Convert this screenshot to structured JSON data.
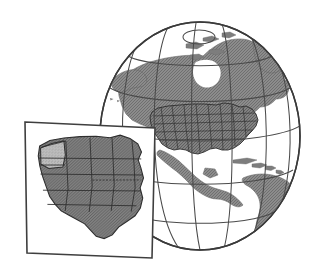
{
  "figure": {
    "title": "Globe showing North America with western United States inset map",
    "width": 323,
    "height": 274,
    "background_color": "#ffffff",
    "style": "line-art halftone illustration"
  },
  "colors": {
    "background": "#ffffff",
    "outline": "#3a3a3a",
    "graticule": "#4a4a4a",
    "land_fill": "#8a8a8a",
    "land_fill_dark": "#7d7d7d",
    "states_fill": "#878787",
    "inset_state_fill": "#858585",
    "inset_highlight_fill": "#b4b4b4",
    "inset_frame_fill": "#ffffff",
    "inset_frame_border": "#3f3f3f",
    "state_border": "#2e2e2e"
  },
  "globe": {
    "name": "earth-globe",
    "center_x": 200,
    "center_y": 136,
    "radius_x": 100,
    "radius_y": 114,
    "graticule": {
      "visible": true,
      "latitude_lines": 5,
      "longitude_lines": 7,
      "polar_cap_visible": true,
      "polar_cap_label": "north-pole-cap"
    },
    "landmasses": [
      {
        "name": "north-america",
        "label": "North America"
      },
      {
        "name": "greenland",
        "label": "Greenland"
      },
      {
        "name": "central-america",
        "label": "Central America"
      },
      {
        "name": "caribbean-islands",
        "label": "Caribbean Islands"
      },
      {
        "name": "south-america-north",
        "label": "northern South America"
      }
    ],
    "overlay": {
      "name": "contiguous-united-states",
      "label": "Contiguous United States",
      "state_borders_visible": true
    }
  },
  "inset": {
    "name": "western-us-inset-map",
    "label": "Western United States",
    "frame": {
      "corners": [
        [
          25,
          122
        ],
        [
          155,
          128
        ],
        [
          152,
          258
        ],
        [
          27,
          253
        ]
      ],
      "rotated": true,
      "border_width": 1.6
    },
    "highlighted_state": {
      "name": "oregon",
      "label": "Oregon",
      "fill": "#b4b4b4"
    },
    "states": [
      "Washington",
      "Oregon",
      "California",
      "Nevada",
      "Idaho",
      "Montana",
      "Wyoming",
      "Utah",
      "Arizona",
      "Colorado",
      "New Mexico",
      "North Dakota",
      "South Dakota",
      "Nebraska",
      "Kansas",
      "Oklahoma",
      "Texas",
      "Minnesota",
      "Iowa",
      "Missouri",
      "Arkansas",
      "Louisiana"
    ],
    "state_borders_visible": true
  }
}
